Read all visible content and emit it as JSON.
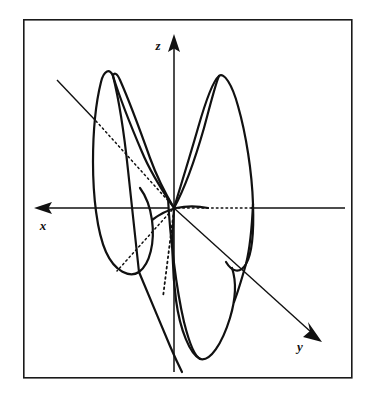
{
  "figure": {
    "title": "",
    "kind": "3d-axes-orbital-diagram",
    "background_color": "#ffffff",
    "ink_color": "#111111",
    "frame": {
      "name": "figure-border",
      "x": 23,
      "y": 19,
      "width": 329,
      "height": 359,
      "stroke": "#1a1a1a",
      "stroke_width": 1.6
    },
    "origin": {
      "x": 174,
      "y": 208
    },
    "axes": [
      {
        "id": "z",
        "label": "z",
        "label_x": 160,
        "label_y": 47,
        "direction": "up",
        "arrow_tip": {
          "x": 174,
          "y": 36
        },
        "tail": {
          "x": 174,
          "y": 372
        },
        "style": "solid"
      },
      {
        "id": "x",
        "label": "x",
        "label_x": 42,
        "label_y": 228,
        "direction": "left",
        "arrow_tip": {
          "x": 36,
          "y": 208
        },
        "tail": {
          "x": 345,
          "y": 208
        },
        "style": "solid-with-hidden-dotted-segment",
        "dotted_from": {
          "x": 174,
          "y": 208
        },
        "dotted_to": {
          "x": 253,
          "y": 208
        }
      },
      {
        "id": "y",
        "label": "y",
        "label_x": 300,
        "label_y": 348,
        "direction": "down-right",
        "arrow_tip": {
          "x": 320,
          "y": 340
        },
        "tail": {
          "x": 57,
          "y": 80
        },
        "style": "solid-with-hidden-dotted-segment",
        "dotted_from": {
          "x": 94,
          "y": 124
        },
        "dotted_to": {
          "x": 174,
          "y": 208
        }
      }
    ],
    "hidden_lines": [
      {
        "name": "y-axis-hidden-segment",
        "from": {
          "x": 94,
          "y": 124
        },
        "to": {
          "x": 174,
          "y": 208
        },
        "style": "dotted"
      },
      {
        "name": "x-axis-hidden-segment",
        "from": {
          "x": 174,
          "y": 208
        },
        "to": {
          "x": 253,
          "y": 208
        },
        "style": "dotted"
      },
      {
        "name": "negative-y-hidden-segment",
        "from": {
          "x": 174,
          "y": 208
        },
        "to": {
          "x": 118,
          "y": 270
        },
        "style": "dotted"
      },
      {
        "name": "negative-z-hidden-segment",
        "from": {
          "x": 174,
          "y": 208
        },
        "to": {
          "x": 163,
          "y": 296
        },
        "style": "dotted"
      }
    ],
    "lobes": [
      {
        "name": "lobe-upper-left-outer",
        "description": "upper-left lobe outer contour, apex near (115,73)",
        "apex": {
          "x": 115,
          "y": 73
        },
        "path": "M 174 208 C 160 190 140 160 126 126 C 112 92 106 72 116 72 C 126 72 132 92 136 126 C 140 164 144 196 150 216 C 156 238 150 262 140 272 C 128 282 110 266 101 232 C 92 198 92 162 97 140 C 101 120 108 104 117 93"
      },
      {
        "name": "lobe-upper-left-inner",
        "description": "upper-left lobe inner contour crossing near origin",
        "path": "M 174 208 C 166 196 154 170 144 136 C 134 102 118 74 116 73"
      },
      {
        "name": "lobe-upper-right-outer",
        "description": "upper-right lobe outer contour, apex near (220,76)",
        "apex": {
          "x": 220,
          "y": 76
        },
        "path": "M 174 208 C 180 186 192 150 202 120 C 212 90 219 76 222 76 C 230 76 242 102 248 140 C 254 180 254 212 252 236 C 250 258 242 272 232 268 C 220 262 206 236 196 208"
      },
      {
        "name": "lobe-upper-right-inner",
        "description": "upper-right lobe inner contour",
        "path": "M 174 208 C 186 186 198 150 206 120 C 214 92 220 78 221 76"
      },
      {
        "name": "lobe-lower-right-outer",
        "description": "lower lobe descending to (205,358)",
        "apex": {
          "x": 205,
          "y": 358
        },
        "path": "M 174 208 C 182 226 192 258 198 292 C 204 326 208 352 206 358 C 200 360 188 340 180 310 C 172 280 168 248 170 226"
      },
      {
        "name": "lobe-lower-right-inner",
        "description": "lower lobe inner strand through origin",
        "path": "M 174 208 C 176 240 180 284 186 316 C 192 344 200 358 205 358"
      },
      {
        "name": "lobe-lower-right-sweep",
        "description": "long sweeping strand from upper right lobe down to bottom lobe",
        "path": "M 232 268 C 238 286 234 308 222 330 C 212 348 206 356 205 358"
      },
      {
        "name": "lobe-lower-left-sweep",
        "description": "strand from left lobe bottom sweeping to lower region",
        "path": "M 140 272 C 150 292 160 320 166 346 C 170 362 172 370 172 372"
      }
    ],
    "dot_pattern": {
      "dash_array": "1.6 3.2",
      "stroke_width": 1.5
    }
  }
}
